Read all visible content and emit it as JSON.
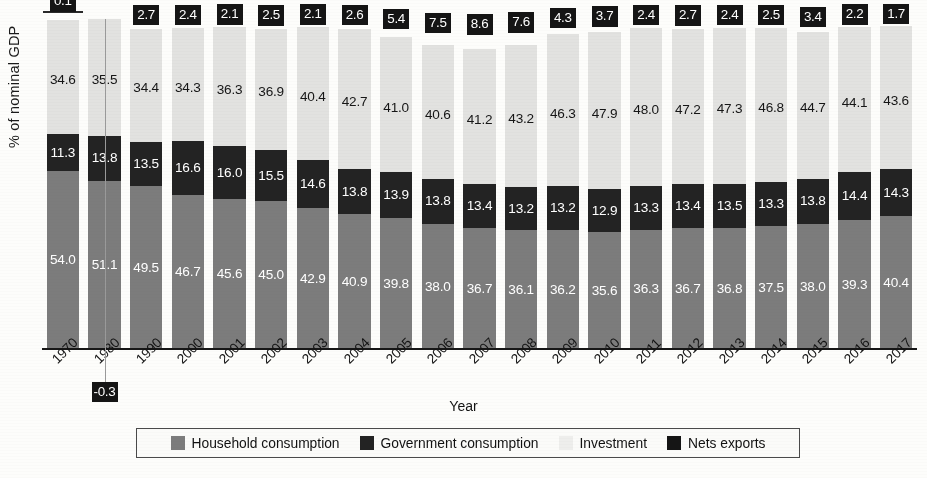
{
  "chart_data": {
    "type": "bar",
    "subtype": "stacked-vertical",
    "title": "",
    "xlabel": "Year",
    "ylabel": "% of nominal GDP",
    "grid": false,
    "legend_position": "bottom",
    "ylim": [
      0,
      100
    ],
    "categories": [
      "1970",
      "1980",
      "1990",
      "2000",
      "2001",
      "2002",
      "2003",
      "2004",
      "2005",
      "2006",
      "2007",
      "2008",
      "2009",
      "2010",
      "2011",
      "2012",
      "2013",
      "2014",
      "2015",
      "2016",
      "2017"
    ],
    "series": [
      {
        "name": "Household consumption",
        "color": "#7c7c7c",
        "values": [
          54.0,
          51.1,
          49.5,
          46.7,
          45.6,
          45.0,
          42.9,
          40.9,
          39.8,
          38.0,
          36.7,
          36.1,
          36.2,
          35.6,
          36.3,
          36.7,
          36.8,
          37.5,
          38.0,
          39.3,
          40.4
        ]
      },
      {
        "name": "Government consumption",
        "color": "#232323",
        "values": [
          11.3,
          13.8,
          13.5,
          16.6,
          16.0,
          15.5,
          14.6,
          13.8,
          13.9,
          13.8,
          13.4,
          13.2,
          13.2,
          12.9,
          13.3,
          13.4,
          13.5,
          13.3,
          13.8,
          14.4,
          14.3
        ]
      },
      {
        "name": "Investment",
        "color": "#e2e2e0",
        "values": [
          34.6,
          35.5,
          34.4,
          34.3,
          36.3,
          36.9,
          40.4,
          42.7,
          41.0,
          40.6,
          41.2,
          43.2,
          46.3,
          47.9,
          48.0,
          47.2,
          47.3,
          46.8,
          44.7,
          44.1,
          43.6
        ]
      },
      {
        "name": "Nets exports",
        "color": "#151515",
        "values": [
          0.1,
          -0.3,
          2.7,
          2.4,
          2.1,
          2.5,
          2.1,
          2.6,
          5.4,
          7.5,
          8.6,
          7.6,
          4.3,
          3.7,
          2.4,
          2.7,
          2.4,
          2.5,
          3.4,
          2.2,
          1.7
        ]
      }
    ]
  },
  "axis": {
    "y_title": "% of nominal GDP",
    "x_title": "Year"
  },
  "legend": {
    "items": [
      {
        "label": "Household consumption",
        "swatch": "household-swatch"
      },
      {
        "label": "Government consumption",
        "swatch": "government-swatch"
      },
      {
        "label": "Investment",
        "swatch": "investment-swatch"
      },
      {
        "label": "Nets exports",
        "swatch": "netexports-swatch"
      }
    ]
  },
  "colors": {
    "household": "#7c7c7c",
    "government": "#232323",
    "investment": "#e2e2e0",
    "net_exports": "#151515",
    "axis": "#171717",
    "page": "#fdfdfb"
  }
}
